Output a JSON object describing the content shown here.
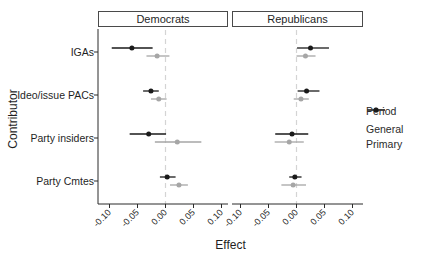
{
  "chart_data": {
    "type": "scatter",
    "subtype": "faceted-dot-whisker-forest-plot",
    "facets": [
      "Democrats",
      "Republicans"
    ],
    "categories": [
      "IGAs",
      "Ideo/issue PACs",
      "Party insiders",
      "Party Cmtes"
    ],
    "xlabel": "Effect",
    "ylabel": "Contributor",
    "xlim": [
      -0.1,
      0.1
    ],
    "xticks": [
      -0.1,
      -0.05,
      0.0,
      0.05,
      0.1
    ],
    "xtick_labels": [
      "-0.10",
      "-0.05",
      "0.00",
      "0.05",
      "0.10"
    ],
    "zero_reference_line": 0,
    "grid": false,
    "legend": {
      "title": "Period",
      "position": "right",
      "entries": [
        {
          "label": "General",
          "color": "#a6a6a6"
        },
        {
          "label": "Primary",
          "color": "#1a1a1a"
        }
      ]
    },
    "series": [
      {
        "facet": "Democrats",
        "period": "Primary",
        "color": "#1a1a1a",
        "values": [
          -0.06,
          -0.026,
          -0.03,
          0.003
        ],
        "ci_low": [
          -0.096,
          -0.04,
          -0.064,
          -0.01
        ],
        "ci_high": [
          -0.023,
          -0.012,
          0.001,
          0.018
        ]
      },
      {
        "facet": "Democrats",
        "period": "General",
        "color": "#a6a6a6",
        "values": [
          -0.015,
          -0.012,
          0.021,
          0.024
        ],
        "ci_low": [
          -0.034,
          -0.026,
          -0.019,
          0.008
        ],
        "ci_high": [
          0.007,
          0.002,
          0.064,
          0.04
        ]
      },
      {
        "facet": "Republicans",
        "period": "Primary",
        "color": "#1a1a1a",
        "values": [
          0.025,
          0.018,
          -0.008,
          -0.003
        ],
        "ci_low": [
          0.001,
          0.002,
          -0.038,
          -0.013
        ],
        "ci_high": [
          0.058,
          0.041,
          0.021,
          0.009
        ]
      },
      {
        "facet": "Republicans",
        "period": "General",
        "color": "#a6a6a6",
        "values": [
          0.016,
          0.008,
          -0.013,
          -0.006
        ],
        "ci_low": [
          0.0,
          -0.005,
          -0.039,
          -0.027
        ],
        "ci_high": [
          0.034,
          0.022,
          0.013,
          0.017
        ]
      }
    ],
    "colors": {
      "axis_line": "#2b2b2b",
      "zero_dash_line": "#d4d4d4",
      "text": "#1f1f1f"
    }
  }
}
